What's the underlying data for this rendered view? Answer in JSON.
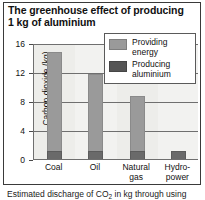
{
  "title": "The greenhouse effect of producing 1 kg of aluminium",
  "caption": {
    "pre": "Estimated discharge of CO",
    "sub": "2",
    "post": " in kg through using"
  },
  "legend": {
    "position": "top-right",
    "items": [
      {
        "label": "Providing energy",
        "color": "#9a9a9a",
        "swatch": "energy-swatch"
      },
      {
        "label": "Producing aluminium",
        "color": "#555555",
        "swatch": "aluminium-swatch"
      }
    ]
  },
  "chart_data": {
    "type": "bar",
    "stacked": true,
    "title": "The greenhouse effect of producing 1 kg of aluminium",
    "xlabel": "",
    "ylabel": "Carbon dioxide (kg)",
    "ylim": [
      0,
      16
    ],
    "yticks": [
      0,
      4,
      8,
      12,
      16
    ],
    "ytick_labels": [
      "0",
      "4",
      "8",
      "12",
      "16"
    ],
    "grid": true,
    "categories": [
      "Coal",
      "Oil",
      "Natural gas",
      "Hydro-power"
    ],
    "category_lines": [
      [
        "Coal"
      ],
      [
        "Oil"
      ],
      [
        "Natural",
        "gas"
      ],
      [
        "Hydro-",
        "power"
      ]
    ],
    "series": [
      {
        "name": "Producing aluminium",
        "color": "#6a6a6a",
        "values": [
          1.1,
          1.1,
          1.1,
          1.1
        ]
      },
      {
        "name": "Providing energy",
        "color": "#9a9a9a",
        "values": [
          13.7,
          10.6,
          7.6,
          0.0
        ]
      }
    ],
    "totals": [
      14.8,
      11.7,
      8.7,
      1.1
    ]
  }
}
